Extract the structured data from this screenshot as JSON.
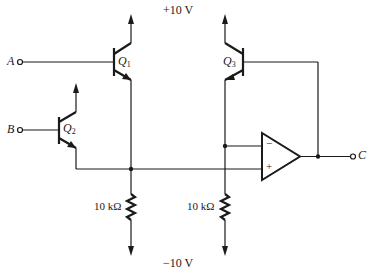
{
  "diagram": {
    "type": "circuit-schematic",
    "supply_positive": "+10 V",
    "supply_negative": "−10 V",
    "terminals": [
      {
        "id": "A",
        "label": "A"
      },
      {
        "id": "B",
        "label": "B"
      },
      {
        "id": "C",
        "label": "C"
      }
    ],
    "transistors": [
      {
        "id": "Q1",
        "letter": "Q",
        "sub": "1",
        "type": "npn"
      },
      {
        "id": "Q2",
        "letter": "Q",
        "sub": "2",
        "type": "npn"
      },
      {
        "id": "Q3",
        "letter": "Q",
        "sub": "3",
        "type": "npn"
      }
    ],
    "resistors": [
      {
        "id": "R1",
        "label": "10 kΩ"
      },
      {
        "id": "R2",
        "label": "10 kΩ"
      }
    ],
    "opamp": {
      "inverting_label": "−",
      "noninverting_label": "+"
    }
  }
}
